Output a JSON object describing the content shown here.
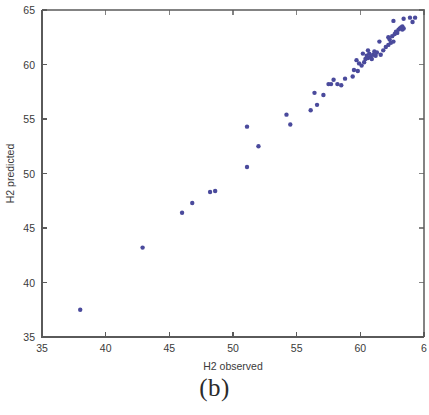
{
  "figure": {
    "caption": "(b)",
    "background_color": "#ffffff",
    "axis_color": "#5a5a5a",
    "text_color": "#3a3a3a"
  },
  "chart_data": {
    "type": "scatter",
    "title": "",
    "xlabel": "H2 observed",
    "ylabel": "H2 predicted",
    "xlim": [
      35,
      65
    ],
    "ylim": [
      35,
      65
    ],
    "xticks": [
      35,
      40,
      45,
      50,
      55,
      60,
      65
    ],
    "xtick_labels": [
      "35",
      "40",
      "45",
      "50",
      "55",
      "60",
      "6"
    ],
    "yticks": [
      35,
      40,
      45,
      50,
      55,
      60,
      65
    ],
    "ytick_labels": [
      "35",
      "40",
      "45",
      "50",
      "55",
      "60",
      "65"
    ],
    "grid": false,
    "legend": null,
    "marker_color": "#4a4a9c",
    "marker_size": 2.2,
    "series": [
      {
        "name": "H2 predicted vs observed",
        "points": [
          [
            38.0,
            37.5
          ],
          [
            42.9,
            43.2
          ],
          [
            46.0,
            46.4
          ],
          [
            46.8,
            47.3
          ],
          [
            48.2,
            48.3
          ],
          [
            48.6,
            48.4
          ],
          [
            51.1,
            50.6
          ],
          [
            52.0,
            52.5
          ],
          [
            51.1,
            54.3
          ],
          [
            54.2,
            55.4
          ],
          [
            54.5,
            54.5
          ],
          [
            56.1,
            55.8
          ],
          [
            56.6,
            56.3
          ],
          [
            56.4,
            57.4
          ],
          [
            57.1,
            57.2
          ],
          [
            57.5,
            58.2
          ],
          [
            57.7,
            58.2
          ],
          [
            58.2,
            58.2
          ],
          [
            58.5,
            58.1
          ],
          [
            57.9,
            58.6
          ],
          [
            59.4,
            58.9
          ],
          [
            59.5,
            59.5
          ],
          [
            59.8,
            59.4
          ],
          [
            59.7,
            60.4
          ],
          [
            60.1,
            59.9
          ],
          [
            60.3,
            60.2
          ],
          [
            60.4,
            60.5
          ],
          [
            60.5,
            60.8
          ],
          [
            60.6,
            60.6
          ],
          [
            60.7,
            61.0
          ],
          [
            60.8,
            60.7
          ],
          [
            60.9,
            60.5
          ],
          [
            61.0,
            60.9
          ],
          [
            61.1,
            61.2
          ],
          [
            61.2,
            60.8
          ],
          [
            61.3,
            61.1
          ],
          [
            60.6,
            61.3
          ],
          [
            61.6,
            60.9
          ],
          [
            61.8,
            61.3
          ],
          [
            62.0,
            61.6
          ],
          [
            62.2,
            61.8
          ],
          [
            62.3,
            62.3
          ],
          [
            62.4,
            62.0
          ],
          [
            62.2,
            62.5
          ],
          [
            62.5,
            62.6
          ],
          [
            62.6,
            62.1
          ],
          [
            62.7,
            62.8
          ],
          [
            62.8,
            63.0
          ],
          [
            62.9,
            62.9
          ],
          [
            63.0,
            63.2
          ],
          [
            62.6,
            64.0
          ],
          [
            63.1,
            63.3
          ],
          [
            63.2,
            63.4
          ],
          [
            63.3,
            63.2
          ],
          [
            63.3,
            63.5
          ],
          [
            63.4,
            63.3
          ],
          [
            63.4,
            64.2
          ],
          [
            63.9,
            64.3
          ],
          [
            64.3,
            64.3
          ],
          [
            64.1,
            63.9
          ],
          [
            61.5,
            62.1
          ],
          [
            60.2,
            61.0
          ],
          [
            59.9,
            60.1
          ],
          [
            58.8,
            58.7
          ]
        ]
      }
    ]
  }
}
